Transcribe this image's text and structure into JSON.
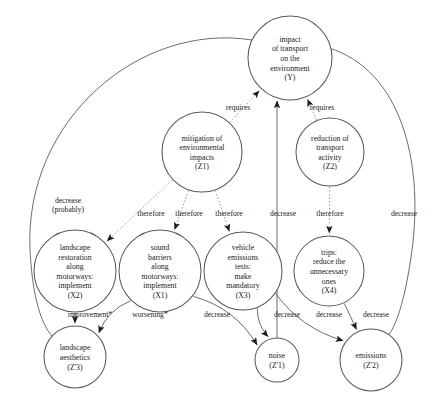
{
  "diagram": {
    "type": "causal-influence-graph",
    "title": "",
    "nodes": [
      {
        "id": "Y",
        "label_lines": [
          "impact",
          "of transport",
          "on the",
          "environment",
          "(Y)"
        ],
        "cx": 290,
        "cy": 58,
        "r": 42
      },
      {
        "id": "Z1",
        "label_lines": [
          "mitigation of",
          "environmental",
          "impacts",
          "(Z1)"
        ],
        "cx": 202,
        "cy": 152,
        "r": 40
      },
      {
        "id": "Z2",
        "label_lines": [
          "reduction of",
          "transport",
          "activity",
          "(Z2)"
        ],
        "cx": 330,
        "cy": 152,
        "r": 34
      },
      {
        "id": "X2",
        "label_lines": [
          "landscape",
          "restoration",
          "along",
          "motorways:",
          "implement",
          "(X2)"
        ],
        "cx": 75,
        "cy": 271,
        "r": 41
      },
      {
        "id": "X1",
        "label_lines": [
          "sound",
          "barriers",
          "along",
          "motorways:",
          "implement",
          "(X1)"
        ],
        "cx": 160,
        "cy": 271,
        "r": 41
      },
      {
        "id": "X3",
        "label_lines": [
          "vehicle",
          "emissions",
          "tests:",
          "make",
          "mandatory",
          "(X3)"
        ],
        "cx": 243,
        "cy": 271,
        "r": 39
      },
      {
        "id": "X4",
        "label_lines": [
          "trips:",
          "reduce the",
          "unnecessary",
          "ones",
          "(X4)"
        ],
        "cx": 329,
        "cy": 271,
        "r": 35
      },
      {
        "id": "Z3",
        "label_lines": [
          "landscape",
          "aesthetics",
          "(Z'3)"
        ],
        "cx": 75,
        "cy": 357,
        "r": 31
      },
      {
        "id": "N1",
        "label_lines": [
          "noise",
          "(Z'1)"
        ],
        "cx": 277,
        "cy": 360,
        "r": 22
      },
      {
        "id": "N2",
        "label_lines": [
          "emissions",
          "(Z'2)"
        ],
        "cx": 371,
        "cy": 360,
        "r": 31
      }
    ],
    "edges": [
      {
        "from": "Z1",
        "to": "Y",
        "label": "requires",
        "style": "dotted",
        "label_x": 238,
        "label_y": 110
      },
      {
        "from": "Z2",
        "to": "Y",
        "label": "requires",
        "style": "dotted",
        "label_x": 322,
        "label_y": 110
      },
      {
        "from": "Y",
        "to": "Z3",
        "label": "decrease (probably)",
        "style": "solid",
        "label_x": 68,
        "label_y": 203
      },
      {
        "from": "Z1",
        "to": "X2",
        "label": "therefore",
        "style": "dotted",
        "label_x": 151,
        "label_y": 216
      },
      {
        "from": "Z1",
        "to": "X1",
        "label": "therefore",
        "style": "dotted",
        "label_x": 189,
        "label_y": 216
      },
      {
        "from": "Z1",
        "to": "X3",
        "label": "therefore",
        "style": "dotted",
        "label_x": 229,
        "label_y": 216
      },
      {
        "from": "N1",
        "to": "Y",
        "label": "decrease",
        "style": "solid",
        "label_x": 283,
        "label_y": 216
      },
      {
        "from": "Z2",
        "to": "X4",
        "label": "therefore",
        "style": "dotted",
        "label_x": 330,
        "label_y": 216
      },
      {
        "from": "Y",
        "to": "N2",
        "label": "decrease",
        "style": "solid",
        "label_x": 404,
        "label_y": 216
      },
      {
        "from": "X2",
        "to": "Z3",
        "label": "improvement*",
        "style": "solid",
        "label_x": 90,
        "label_y": 317
      },
      {
        "from": "X1",
        "to": "Z3",
        "label": "worsening*",
        "style": "solid",
        "label_x": 150,
        "label_y": 317
      },
      {
        "from": "X3",
        "to": "N1",
        "label": "decrease",
        "style": "solid",
        "label_x": 217,
        "label_y": 317
      },
      {
        "from": "X1",
        "to": "N1",
        "label": "decrease",
        "style": "solid",
        "label_x": 287,
        "label_y": 317
      },
      {
        "from": "X3",
        "to": "N2",
        "label": "decrease",
        "style": "solid",
        "label_x": 329,
        "label_y": 317
      },
      {
        "from": "X4",
        "to": "N2",
        "label": "decrease",
        "style": "solid",
        "label_x": 376,
        "label_y": 317
      }
    ],
    "footnote": "",
    "colors": {
      "background": "#ffffff",
      "node_stroke": "#5a5a5a",
      "edge_solid": "#6d6d6d",
      "edge_dotted": "#9a9a9a",
      "text": "#1a1a1a"
    }
  }
}
